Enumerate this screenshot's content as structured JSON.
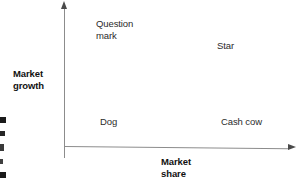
{
  "figure": {
    "type": "bcg-growth-share-matrix",
    "background_color": "#ffffff",
    "axis_color": "#8c8c8c",
    "arrow_color": "#4a4a4a",
    "label_color": "#2b2b2b",
    "title_color": "#111111"
  },
  "axes": {
    "vertical": {
      "title": "Market\ngrowth",
      "title_line1": "Market",
      "title_line2": "growth",
      "arrow": "up-arrowhead"
    },
    "horizontal": {
      "title": "Market\nshare",
      "title_line1": "Market",
      "title_line2": "share",
      "arrow": "right-arrowhead"
    }
  },
  "quadrants": [
    {
      "id": "question-mark",
      "label": "Question\nmark",
      "position": "top-left",
      "market_growth": "high",
      "market_share": "low"
    },
    {
      "id": "star",
      "label": "Star",
      "position": "top-right",
      "market_growth": "high",
      "market_share": "high"
    },
    {
      "id": "dog",
      "label": "Dog",
      "position": "bottom-left",
      "market_growth": "low",
      "market_share": "low"
    },
    {
      "id": "cash-cow",
      "label": "Cash cow",
      "position": "bottom-right",
      "market_growth": "low",
      "market_share": "high"
    }
  ],
  "chart_data": {
    "type": "scatter",
    "title": "",
    "xlabel": "Market share",
    "ylabel": "Market growth",
    "grid": false,
    "legend": "none",
    "xlim": [
      0,
      1
    ],
    "ylim": [
      0,
      1
    ],
    "annotations": [
      {
        "text": "Question mark",
        "x": 0.18,
        "y": 0.85
      },
      {
        "text": "Star",
        "x": 0.7,
        "y": 0.68
      },
      {
        "text": "Dog",
        "x": 0.18,
        "y": 0.22
      },
      {
        "text": "Cash cow",
        "x": 0.7,
        "y": 0.22
      }
    ],
    "x": [],
    "values": []
  },
  "page_edge_fragments": {
    "description": "cropped glyph fragments bleeding in from adjacent page column",
    "count": 5
  }
}
